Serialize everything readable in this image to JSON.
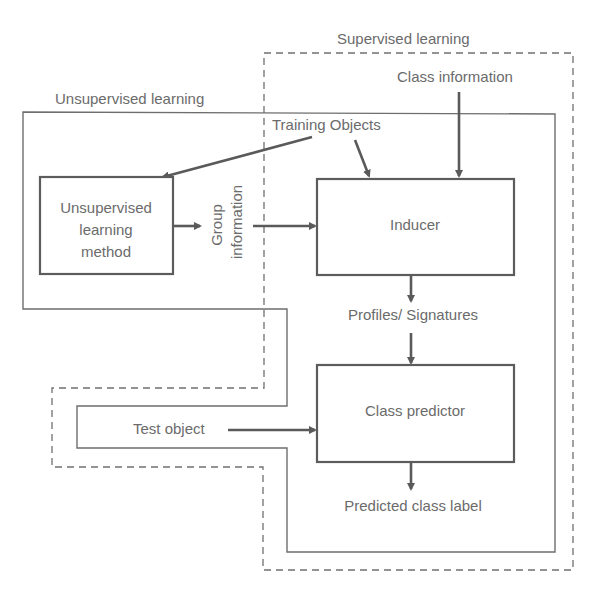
{
  "diagram": {
    "regions": {
      "supervised": {
        "label": "Supervised learning",
        "style": "dashed"
      },
      "unsupervised": {
        "label": "Unsupervised learning",
        "style": "solid"
      }
    },
    "nodes": {
      "unsupervised_method": {
        "line1": "Unsupervised",
        "line2": "learning",
        "line3": "method"
      },
      "inducer": {
        "label": "Inducer"
      },
      "class_predictor": {
        "label": "Class predictor"
      }
    },
    "labels": {
      "class_information": "Class information",
      "training_objects": "Training Objects",
      "group_line1": "Group",
      "group_line2": "information",
      "profiles": "Profiles/ Signatures",
      "test_object": "Test object",
      "predicted": "Predicted class label"
    },
    "edges": [
      {
        "from": "Training Objects",
        "to": "Unsupervised learning method"
      },
      {
        "from": "Training Objects",
        "to": "Inducer"
      },
      {
        "from": "Class information",
        "to": "Inducer"
      },
      {
        "from": "Unsupervised learning method",
        "to": "Group information"
      },
      {
        "from": "Group information",
        "to": "Inducer"
      },
      {
        "from": "Inducer",
        "to": "Profiles/ Signatures"
      },
      {
        "from": "Profiles/ Signatures",
        "to": "Class predictor"
      },
      {
        "from": "Test object",
        "to": "Class predictor"
      },
      {
        "from": "Class predictor",
        "to": "Predicted class label"
      }
    ],
    "colors": {
      "line": "#6e6e6e",
      "text": "#6b6b6b",
      "background": "#ffffff"
    }
  }
}
